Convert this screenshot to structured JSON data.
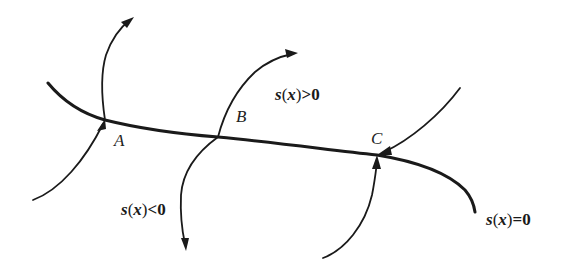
{
  "diagram": {
    "type": "sliding-mode phase portrait",
    "switching_surface": {
      "label": "s(x)=0",
      "label_parts": {
        "fn": "s",
        "open": "(",
        "arg": "x",
        "close": ")",
        "rel": "=0"
      }
    },
    "regions": [
      {
        "id": "positive",
        "label": "s(x)>0",
        "label_parts": {
          "fn": "s",
          "open": "(",
          "arg": "x",
          "close": ")",
          "rel": ">0"
        }
      },
      {
        "id": "negative",
        "label": "s(x)<0",
        "label_parts": {
          "fn": "s",
          "open": "(",
          "arg": "x",
          "close": ")",
          "rel": "<0"
        }
      }
    ],
    "points": [
      {
        "id": "A",
        "label": "A",
        "behavior": "trajectory crosses surface from s<0 to s>0"
      },
      {
        "id": "B",
        "label": "B",
        "behavior": "trajectories diverge from surface on both sides"
      },
      {
        "id": "C",
        "label": "C",
        "behavior": "trajectories converge to surface from both sides"
      }
    ],
    "colors": {
      "stroke": "#1a1a1a",
      "background": "#ffffff"
    }
  }
}
